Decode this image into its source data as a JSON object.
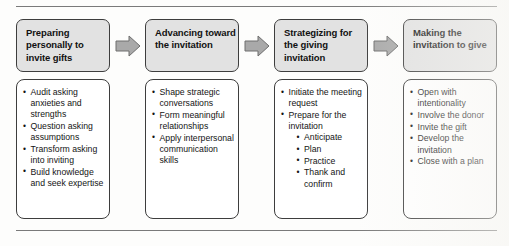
{
  "diagram": {
    "type": "process-flow",
    "orientation": "horizontal",
    "stage_count": 4,
    "colors": {
      "header_fill": "#e2e2e2",
      "body_fill": "#ffffff",
      "border": "#3d3d3d",
      "arrow_fill": "#a9a9a9",
      "arrow_stroke": "#6e6e6e",
      "rule": "#7a7a7a",
      "text": "#141414"
    },
    "arrow_icon_name": "right-arrow-icon",
    "stages": [
      {
        "id": "stage-1",
        "title": "Preparing personally to invite gifts",
        "items": [
          {
            "text": "Audit asking anxieties and strengths",
            "sub": []
          },
          {
            "text": "Question asking assumptions",
            "sub": []
          },
          {
            "text": "Transform asking into inviting",
            "sub": []
          },
          {
            "text": "Build knowledge and seek expertise",
            "sub": []
          }
        ]
      },
      {
        "id": "stage-2",
        "title": "Advancing toward the invitation",
        "items": [
          {
            "text": "Shape strategic conversations",
            "sub": []
          },
          {
            "text": "Form meaningful relationships",
            "sub": []
          },
          {
            "text": "Apply interpersonal communication skills",
            "sub": []
          }
        ]
      },
      {
        "id": "stage-3",
        "title": "Strategizing for the giving invitation",
        "items": [
          {
            "text": "Initiate the meeting request",
            "sub": []
          },
          {
            "text": "Prepare for the invitation",
            "sub": [
              "Anticipate",
              "Plan",
              "Practice",
              "Thank and confirm"
            ]
          }
        ]
      },
      {
        "id": "stage-4",
        "title": "Making the invitation to give",
        "items": [
          {
            "text": "Open with intentionality",
            "sub": []
          },
          {
            "text": "Involve the donor",
            "sub": []
          },
          {
            "text": "Invite the gift",
            "sub": []
          },
          {
            "text": "Develop the invitation",
            "sub": []
          },
          {
            "text": "Close with a plan",
            "sub": []
          }
        ]
      }
    ]
  }
}
